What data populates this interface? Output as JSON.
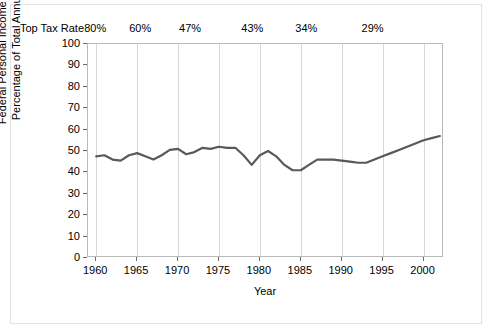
{
  "chart_data": {
    "type": "line",
    "title": "",
    "xlabel": "Year",
    "ylabel": "Federal Personal Income Taxes as a Percentage of Total Annual Income",
    "ylabel_lines": [
      "Federal Personal Income Taxes as a",
      "Percentage of Total Annual Income"
    ],
    "xlim": [
      1959,
      2002.5
    ],
    "ylim": [
      0,
      100
    ],
    "ytick_labels": [
      "0",
      "10",
      "20",
      "30",
      "40",
      "50",
      "60",
      "70",
      "80",
      "90",
      "100"
    ],
    "ytick_values": [
      0,
      10,
      20,
      30,
      40,
      50,
      60,
      70,
      80,
      90,
      100
    ],
    "xtick_labels": [
      "1960",
      "1965",
      "1970",
      "1975",
      "1980",
      "1985",
      "1990",
      "1995",
      "2000"
    ],
    "xtick_values": [
      1960,
      1965,
      1970,
      1975,
      1980,
      1985,
      1990,
      1995,
      2000
    ],
    "grid": "vertical",
    "legend": "none",
    "line_color": "#595959",
    "secondary_axis": {
      "label": "Top Tax Rate",
      "ticks": [
        {
          "year": 1960.0,
          "label": "80%"
        },
        {
          "year": 1965.5,
          "label": "60%"
        },
        {
          "year": 1971.6,
          "label": "47%"
        },
        {
          "year": 1979.2,
          "label": "43%"
        },
        {
          "year": 1985.8,
          "label": "34%"
        },
        {
          "year": 1993.9,
          "label": "29%"
        }
      ]
    },
    "x": [
      1960,
      1961,
      1962,
      1963,
      1964,
      1965,
      1966,
      1967,
      1968,
      1969,
      1970,
      1971,
      1972,
      1973,
      1974,
      1975,
      1976,
      1977,
      1978,
      1979,
      1980,
      1981,
      1982,
      1983,
      1984,
      1985,
      1986,
      1987,
      1988,
      1989,
      1990,
      1991,
      1992,
      1993,
      1994,
      1995,
      1996,
      1997,
      1998,
      1999,
      2000,
      2001,
      2002
    ],
    "values": [
      47.5,
      48.0,
      46.0,
      45.5,
      48.0,
      49.0,
      47.5,
      46.0,
      48.0,
      50.5,
      51.0,
      48.5,
      49.5,
      51.5,
      51.0,
      52.0,
      51.5,
      51.5,
      48.0,
      43.5,
      48.0,
      50.0,
      47.5,
      43.5,
      41.0,
      41.0,
      43.5,
      46.0,
      46.0,
      46.0,
      45.5,
      45.0,
      44.5,
      44.5,
      46.0,
      47.5,
      49.0,
      50.5,
      52.0,
      53.5,
      55.0,
      56.0,
      57.0
    ]
  }
}
